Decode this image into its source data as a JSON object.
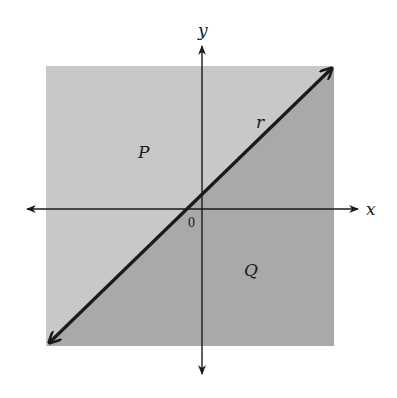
{
  "diagram": {
    "type": "coordinate-plane-regions",
    "axes": {
      "x_label": "x",
      "y_label": "y",
      "origin_label": "0"
    },
    "line": {
      "label": "r",
      "description": "line through origin with positive slope, arrows at both ends"
    },
    "regions": [
      {
        "label": "P",
        "position": "above/left of line r",
        "color": "#c8c8c8"
      },
      {
        "label": "Q",
        "position": "below/right of line r",
        "color": "#a9a9a9"
      }
    ],
    "colors": {
      "region_p": "#c8c8c8",
      "region_q": "#a9a9a9",
      "line": "#1a1a1a",
      "axes": "#1a1a1a",
      "background": "#ffffff"
    }
  }
}
